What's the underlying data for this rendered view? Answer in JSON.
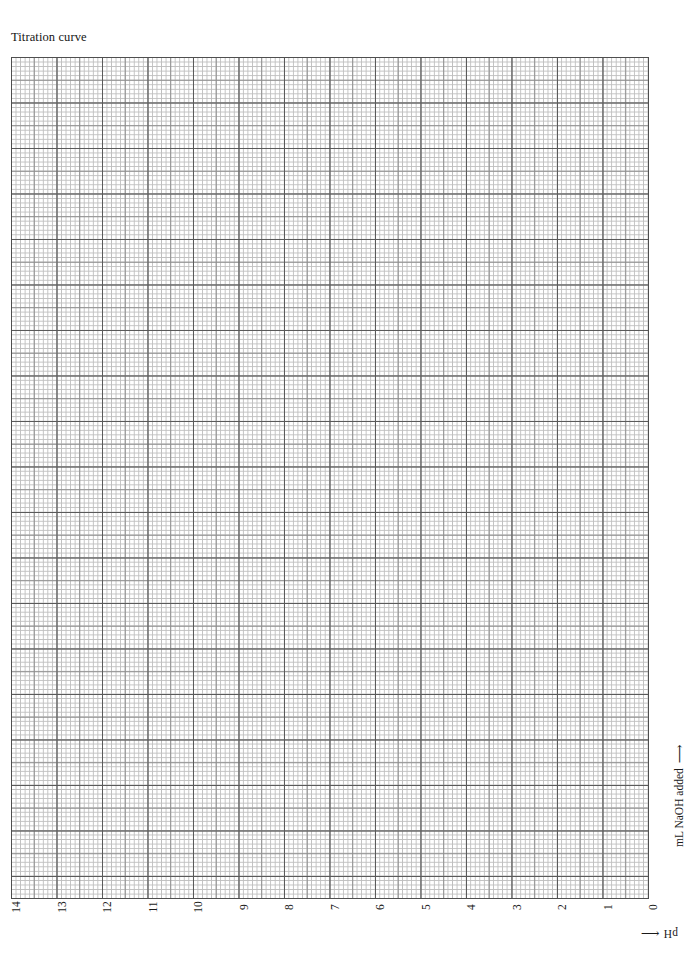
{
  "title": "Titration curve",
  "axes": {
    "x": {
      "caption_text": "pH",
      "caption_arrow": "⟵",
      "ticks": [
        "14",
        "13",
        "12",
        "11",
        "10",
        "9",
        "8",
        "7",
        "6",
        "5",
        "4",
        "3",
        "2",
        "1",
        "0"
      ]
    },
    "y": {
      "caption_text": "mL NaOH added",
      "caption_arrow": "⟶"
    }
  },
  "colors": {
    "fine_grid": "#bfbfbf",
    "medium_grid": "#8e8e8e",
    "heavy_grid": "#5a5a5a",
    "frame": "#4f4f4f",
    "background": "#ffffff",
    "text": "#1a1a1a"
  },
  "chart_data": {
    "type": "line",
    "title": "Titration curve",
    "xlabel": "pH",
    "ylabel": "mL NaOH added",
    "xlim": [
      14,
      0
    ],
    "ylim": [
      0,
      18.5
    ],
    "x_tick_labels": [
      "14",
      "13",
      "12",
      "11",
      "10",
      "9",
      "8",
      "7",
      "6",
      "5",
      "4",
      "3",
      "2",
      "1",
      "0"
    ],
    "x_ticks": [
      14,
      13,
      12,
      11,
      10,
      9,
      8,
      7,
      6,
      5,
      4,
      3,
      2,
      1,
      0
    ],
    "y_tick_labels": [],
    "grid": "graph-paper: minor 1 unit, medium every 5 units, major every 10 units",
    "legend": "none",
    "series": [],
    "values": [],
    "annotations": [],
    "note": "Blank graph paper worksheet - no data plotted"
  }
}
